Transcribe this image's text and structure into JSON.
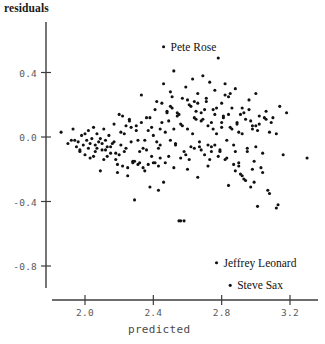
{
  "chart_data": {
    "type": "scatter",
    "title": "",
    "xlabel": "predicted",
    "ylabel": "residuals",
    "xlim": [
      1.82,
      3.33
    ],
    "ylim": [
      -0.92,
      0.62
    ],
    "grid": false,
    "legend": "none",
    "marker": {
      "shape": "circle",
      "color": "#111111",
      "size_px": 3.1
    },
    "xticks": [
      2.0,
      2.4,
      2.8,
      3.2
    ],
    "xtick_labels": [
      "2.0",
      "2.4",
      "2.8",
      "3.2"
    ],
    "yticks": [
      0.4,
      0.0,
      -0.4,
      -0.8
    ],
    "ytick_labels": [
      "0.4",
      "0.0",
      "-0.4",
      "-0.8"
    ],
    "annotations": [
      {
        "text": "Pete Rose",
        "x": 2.46,
        "y": 0.56,
        "marker": true
      },
      {
        "text": "Jeffrey Leonard",
        "x": 2.77,
        "y": -0.78,
        "marker": true
      },
      {
        "text": "Steve Sax",
        "x": 2.85,
        "y": -0.92,
        "marker": true
      }
    ],
    "x": [
      1.86,
      1.9,
      1.92,
      1.93,
      1.95,
      1.96,
      1.97,
      1.98,
      1.99,
      2.0,
      2.01,
      2.02,
      2.02,
      2.03,
      2.04,
      2.05,
      2.06,
      2.06,
      2.07,
      2.08,
      2.09,
      2.1,
      2.11,
      2.12,
      2.13,
      2.14,
      2.15,
      2.16,
      2.17,
      2.18,
      2.19,
      2.2,
      2.21,
      2.22,
      2.23,
      2.24,
      2.25,
      2.26,
      2.27,
      2.28,
      2.29,
      2.3,
      2.31,
      2.32,
      2.33,
      2.34,
      2.35,
      2.36,
      2.37,
      2.38,
      2.39,
      2.4,
      2.41,
      2.42,
      2.43,
      2.44,
      2.45,
      2.46,
      2.47,
      2.48,
      2.49,
      2.5,
      2.51,
      2.52,
      2.53,
      2.54,
      2.55,
      2.56,
      2.57,
      2.58,
      2.59,
      2.6,
      2.61,
      2.62,
      2.63,
      2.64,
      2.65,
      2.66,
      2.67,
      2.68,
      2.69,
      2.7,
      2.71,
      2.72,
      2.73,
      2.74,
      2.75,
      2.76,
      2.77,
      2.78,
      2.79,
      2.8,
      2.81,
      2.82,
      2.83,
      2.84,
      2.85,
      2.86,
      2.87,
      2.88,
      2.89,
      2.9,
      2.91,
      2.92,
      2.93,
      2.94,
      2.95,
      2.96,
      2.97,
      2.98,
      2.99,
      3.0,
      3.01,
      3.02,
      3.04,
      3.06,
      3.08,
      3.1,
      3.12,
      3.14,
      3.16,
      3.18,
      3.3,
      1.94,
      1.97,
      2.0,
      2.03,
      2.05,
      2.07,
      2.09,
      2.11,
      2.13,
      2.15,
      2.17,
      2.19,
      2.21,
      2.23,
      2.25,
      2.27,
      2.29,
      2.31,
      2.33,
      2.35,
      2.37,
      2.39,
      2.41,
      2.43,
      2.45,
      2.47,
      2.49,
      2.51,
      2.53,
      2.55,
      2.57,
      2.59,
      2.61,
      2.63,
      2.65,
      2.67,
      2.69,
      2.71,
      2.73,
      2.75,
      2.77,
      2.79,
      2.81,
      2.83,
      2.85,
      2.87,
      2.89,
      2.91,
      2.93,
      2.95,
      2.97,
      2.99,
      3.01,
      3.03,
      3.05,
      3.07,
      3.09,
      2.28,
      2.36,
      2.44,
      2.52,
      2.6,
      2.68,
      2.76,
      2.84,
      2.92,
      3.0,
      2.1,
      2.2,
      2.3,
      2.4,
      2.5,
      2.56,
      2.64,
      2.72,
      2.8,
      2.88,
      2.54,
      2.66,
      2.74,
      2.82,
      2.9,
      2.98,
      3.06,
      3.13,
      2.46,
      2.38,
      2.62,
      2.7,
      2.78,
      2.86,
      2.94,
      3.02,
      2.58,
      2.5,
      2.42,
      2.34,
      2.66,
      2.74,
      2.82,
      2.9,
      2.98,
      2.24,
      2.32,
      2.48,
      2.56,
      2.64,
      2.72,
      2.8,
      2.88,
      2.96,
      3.04,
      3.12,
      2.18,
      2.26,
      2.44,
      2.52,
      2.6,
      2.68,
      2.76,
      2.84,
      2.92,
      3.0,
      3.08,
      2.12,
      2.22,
      2.43
    ],
    "y": [
      0.03,
      -0.04,
      -0.02,
      0.05,
      -0.06,
      -0.03,
      -0.09,
      0.01,
      -0.05,
      -0.11,
      -0.02,
      0.04,
      -0.07,
      -0.13,
      -0.01,
      0.06,
      -0.05,
      -0.09,
      0.02,
      -0.03,
      -0.21,
      -0.08,
      0.05,
      -0.02,
      -0.12,
      0.01,
      -0.06,
      -0.04,
      0.08,
      -0.1,
      -0.22,
      0.14,
      -0.05,
      -0.18,
      0.02,
      -0.07,
      -0.24,
      0.1,
      -0.03,
      -0.15,
      -0.39,
      0.04,
      -0.17,
      -0.09,
      0.26,
      -0.19,
      -0.02,
      0.12,
      -0.17,
      -0.31,
      0.06,
      0.01,
      -0.16,
      0.22,
      -0.18,
      -0.05,
      0.09,
      -0.28,
      0.03,
      0.16,
      -0.12,
      0.28,
      0.18,
      0.41,
      -0.05,
      0.13,
      -0.52,
      0.08,
      0.24,
      -0.09,
      0.31,
      0.05,
      -0.14,
      0.19,
      0.36,
      -0.07,
      0.11,
      0.27,
      -0.03,
      0.15,
      0.38,
      -0.11,
      0.22,
      0.07,
      0.34,
      -0.06,
      0.17,
      0.29,
      0.02,
      0.49,
      -0.08,
      0.21,
      0.12,
      0.33,
      -0.13,
      0.25,
      0.06,
      0.18,
      -0.05,
      0.3,
      0.09,
      -0.18,
      0.14,
      0.02,
      -0.26,
      0.11,
      -0.09,
      0.23,
      -0.31,
      0.05,
      -0.15,
      0.27,
      -0.43,
      0.08,
      -0.22,
      0.16,
      -0.35,
      0.12,
      -0.44,
      0.19,
      -0.11,
      0.15,
      -0.13,
      -0.02,
      -0.08,
      0.02,
      -0.04,
      -0.12,
      -0.07,
      -0.01,
      -0.14,
      -0.06,
      -0.1,
      -0.03,
      -0.17,
      0.03,
      -0.09,
      -0.19,
      0.06,
      -0.15,
      -0.02,
      0.09,
      -0.21,
      0.04,
      -0.12,
      0.17,
      -0.07,
      0.21,
      -0.16,
      0.1,
      0.25,
      -0.04,
      0.14,
      0.07,
      -0.11,
      0.2,
      0.02,
      0.16,
      -0.06,
      0.11,
      0.24,
      -0.14,
      0.05,
      0.18,
      -0.09,
      0.13,
      -0.02,
      0.27,
      -0.17,
      0.08,
      -0.23,
      0.15,
      -0.07,
      0.1,
      -0.28,
      0.04,
      -0.19,
      0.12,
      -0.33,
      0.09,
      -0.16,
      -0.08,
      -0.13,
      0.05,
      -0.2,
      0.1,
      -0.05,
      0.14,
      -0.24,
      0.07,
      -0.04,
      -0.11,
      0.07,
      -0.16,
      -0.02,
      -0.52,
      0.12,
      -0.18,
      0.06,
      -0.09,
      0.15,
      -0.25,
      0.09,
      -0.14,
      0.03,
      -0.2,
      0.11,
      -0.42,
      0.33,
      0.12,
      -0.06,
      0.17,
      -0.12,
      0.05,
      -0.27,
      0.13,
      -0.52,
      0.19,
      -0.03,
      -0.07,
      0.21,
      -0.09,
      0.26,
      -0.16,
      0.07,
      0.07,
      -0.16,
      0.15,
      -0.13,
      0.22,
      -0.05,
      0.09,
      -0.21,
      0.17,
      -0.1,
      0.02,
      -0.14,
      0.11,
      0.05,
      -0.19,
      0.23,
      -0.08,
      0.14,
      -0.3,
      0.18,
      -0.06,
      0.03,
      -0.08,
      0.13,
      -0.33
    ]
  }
}
